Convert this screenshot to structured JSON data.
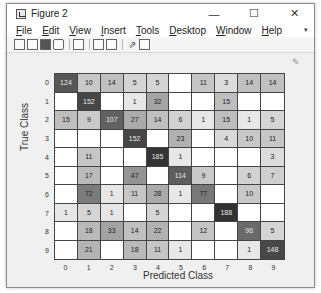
{
  "window": {
    "title": "Figure 2",
    "controls": {
      "minimize": "—",
      "maximize": "☐",
      "close": "✕"
    }
  },
  "menubar": {
    "items": [
      {
        "label": "File",
        "mnemonic": "F"
      },
      {
        "label": "Edit",
        "mnemonic": "E"
      },
      {
        "label": "View",
        "mnemonic": "V"
      },
      {
        "label": "Insert",
        "mnemonic": "I"
      },
      {
        "label": "Tools",
        "mnemonic": "T"
      },
      {
        "label": "Desktop",
        "mnemonic": "D"
      },
      {
        "label": "Window",
        "mnemonic": "W"
      },
      {
        "label": "Help",
        "mnemonic": "H"
      }
    ],
    "overflow_arrow": "▾"
  },
  "toolbar": {
    "icons": [
      "new-figure-icon",
      "open-file-icon",
      "save-icon",
      "print-icon",
      "print-preview-icon",
      "link-plot-icon",
      "insert-colorbar-icon",
      "pointer-icon",
      "property-editor-icon"
    ]
  },
  "figure": {
    "brush_icon": "✎",
    "ylabel": "True Class",
    "xlabel": "Predicted Class"
  },
  "chart_data": {
    "type": "heatmap",
    "title": "",
    "xlabel": "Predicted Class",
    "ylabel": "True Class",
    "x_ticks": [
      "0",
      "1",
      "2",
      "3",
      "4",
      "5",
      "6",
      "7",
      "8",
      "9"
    ],
    "y_ticks": [
      "0",
      "1",
      "2",
      "3",
      "4",
      "5",
      "6",
      "7",
      "8",
      "9"
    ],
    "matrix": [
      [
        124,
        10,
        14,
        5,
        5,
        null,
        11,
        3,
        14,
        14
      ],
      [
        null,
        152,
        null,
        1,
        32,
        null,
        null,
        15,
        null,
        null
      ],
      [
        15,
        9,
        107,
        27,
        14,
        6,
        1,
        15,
        1,
        5
      ],
      [
        null,
        null,
        null,
        152,
        null,
        23,
        null,
        4,
        10,
        11
      ],
      [
        null,
        11,
        null,
        null,
        185,
        1,
        null,
        null,
        null,
        3
      ],
      [
        null,
        17,
        null,
        47,
        null,
        114,
        9,
        null,
        6,
        7
      ],
      [
        null,
        72,
        1,
        11,
        28,
        1,
        77,
        null,
        10,
        null
      ],
      [
        1,
        5,
        1,
        null,
        5,
        null,
        null,
        188,
        null,
        null
      ],
      [
        null,
        18,
        33,
        14,
        22,
        null,
        12,
        null,
        96,
        5
      ],
      [
        null,
        21,
        null,
        18,
        11,
        1,
        null,
        null,
        1,
        148
      ]
    ],
    "colormap": "grayscale",
    "max_value": 188
  }
}
